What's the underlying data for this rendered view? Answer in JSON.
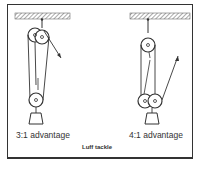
{
  "figure": {
    "caption": "Luff tackle",
    "diagrams": [
      {
        "label": "3:1 advantage"
      },
      {
        "label": "4:1 advantage"
      }
    ]
  }
}
